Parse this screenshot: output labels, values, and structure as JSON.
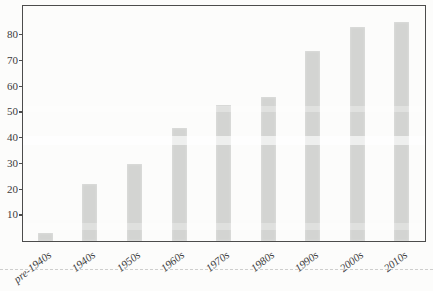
{
  "chart_data": {
    "type": "bar",
    "categories": [
      "pre-1940s",
      "1940s",
      "1950s",
      "1960s",
      "1970s",
      "1980s",
      "1990s",
      "2000s",
      "2010s"
    ],
    "values": [
      3,
      22,
      30,
      44,
      53,
      56,
      74,
      83,
      85
    ],
    "title": "",
    "xlabel": "",
    "ylabel": "",
    "ylim": [
      0,
      91
    ],
    "yticks": [
      10,
      20,
      30,
      40,
      50,
      60,
      70,
      80
    ],
    "grid": false,
    "legend": null,
    "bar_color": "#d3d4d2",
    "frame_color": "#4c4c4c",
    "tick_label_color": "#3b3b3b"
  }
}
